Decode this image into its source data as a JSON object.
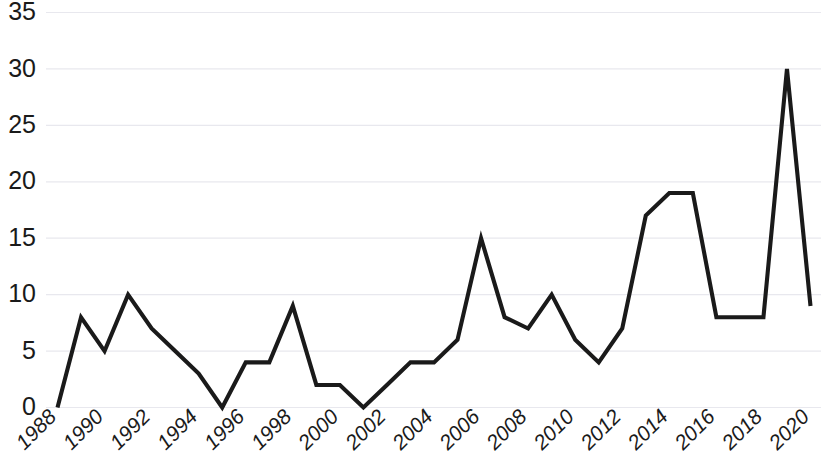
{
  "chart_data": {
    "type": "line",
    "title": "",
    "subtitle": "",
    "xlabel": "",
    "ylabel": "",
    "x": [
      1988,
      1989,
      1990,
      1991,
      1992,
      1993,
      1994,
      1995,
      1996,
      1997,
      1998,
      1999,
      2000,
      2001,
      2002,
      2003,
      2004,
      2005,
      2006,
      2007,
      2008,
      2009,
      2010,
      2011,
      2012,
      2013,
      2014,
      2015,
      2016,
      2017,
      2018,
      2019,
      2020
    ],
    "values": [
      0,
      8,
      5,
      10,
      7,
      5,
      3,
      0,
      4,
      4,
      9,
      2,
      2,
      0,
      2,
      4,
      4,
      6,
      15,
      8,
      7,
      10,
      6,
      4,
      7,
      17,
      19,
      19,
      8,
      8,
      8,
      30,
      9
    ],
    "series": [
      {
        "name": "",
        "values": [
          0,
          8,
          5,
          10,
          7,
          5,
          3,
          0,
          4,
          4,
          9,
          2,
          2,
          0,
          2,
          4,
          4,
          6,
          15,
          8,
          7,
          10,
          6,
          4,
          7,
          17,
          19,
          19,
          8,
          8,
          8,
          30,
          9
        ],
        "color": "#1a1a1a"
      }
    ],
    "xtick_labels": [
      "1988",
      "1990",
      "1992",
      "1994",
      "1996",
      "1998",
      "2000",
      "2002",
      "2004",
      "2006",
      "2008",
      "2010",
      "2012",
      "2014",
      "2016",
      "2018",
      "2020"
    ],
    "xtick_values": [
      1988,
      1990,
      1992,
      1994,
      1996,
      1998,
      2000,
      2002,
      2004,
      2006,
      2008,
      2010,
      2012,
      2014,
      2016,
      2018,
      2020
    ],
    "ytick_labels": [
      "0",
      "5",
      "10",
      "15",
      "20",
      "25",
      "30",
      "35"
    ],
    "ytick_values": [
      0,
      5,
      10,
      15,
      20,
      25,
      30,
      35
    ],
    "xlim": [
      1988,
      2020
    ],
    "ylim": [
      0,
      35
    ],
    "grid": true,
    "grid_axis": "y",
    "grid_color": "#e8e8ee",
    "legend": false,
    "legend_position": "none",
    "background_color": "#ffffff",
    "line_color": "#1a1a1a",
    "xtick_rotation": 45,
    "annotations": []
  }
}
